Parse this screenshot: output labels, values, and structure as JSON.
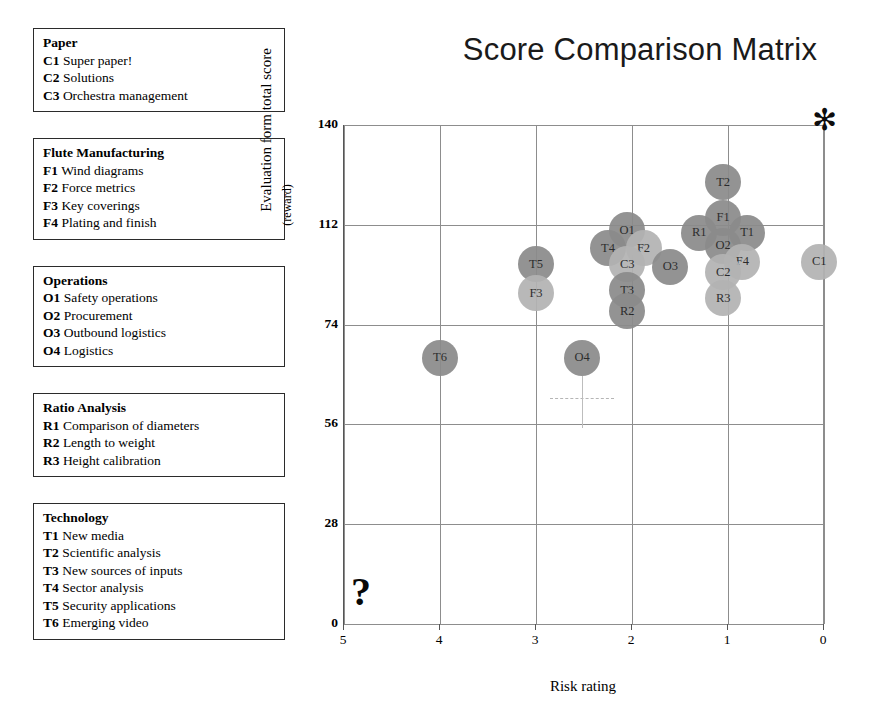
{
  "chart_data": {
    "type": "scatter",
    "title": "Score Comparison Matrix",
    "xlabel": "Risk rating",
    "ylabel": "Evaluation form total score",
    "ylabel_sub": "(reward)",
    "xlim": [
      5,
      0
    ],
    "ylim": [
      0,
      140
    ],
    "x_reversed": true,
    "grid": true,
    "legend_position": "left-panel",
    "xticks": [
      "5",
      "4",
      "3",
      "2",
      "1",
      "0"
    ],
    "yticks": [
      "140",
      "112",
      "74",
      "56",
      "28",
      "0"
    ],
    "points": [
      {
        "code": "T2",
        "x": 1.05,
        "y": 124,
        "shade": "dark"
      },
      {
        "code": "F1",
        "x": 1.05,
        "y": 114,
        "shade": "dark"
      },
      {
        "code": "R1",
        "x": 1.3,
        "y": 109,
        "shade": "dark"
      },
      {
        "code": "T1",
        "x": 0.8,
        "y": 109,
        "shade": "dark"
      },
      {
        "code": "O2",
        "x": 1.05,
        "y": 104,
        "shade": "dark"
      },
      {
        "code": "F4",
        "x": 0.85,
        "y": 98,
        "shade": "light"
      },
      {
        "code": "C2",
        "x": 1.05,
        "y": 94,
        "shade": "light"
      },
      {
        "code": "R3",
        "x": 1.05,
        "y": 84,
        "shade": "light"
      },
      {
        "code": "C1",
        "x": 0.05,
        "y": 98,
        "shade": "light"
      },
      {
        "code": "O1",
        "x": 2.05,
        "y": 110,
        "shade": "dark"
      },
      {
        "code": "T4",
        "x": 2.25,
        "y": 103,
        "shade": "dark"
      },
      {
        "code": "F2",
        "x": 1.88,
        "y": 103,
        "shade": "light"
      },
      {
        "code": "C3",
        "x": 2.05,
        "y": 97,
        "shade": "light"
      },
      {
        "code": "T3",
        "x": 2.05,
        "y": 87,
        "shade": "dark"
      },
      {
        "code": "R2",
        "x": 2.05,
        "y": 79,
        "shade": "dark"
      },
      {
        "code": "O3",
        "x": 1.6,
        "y": 96,
        "shade": "dark"
      },
      {
        "code": "T5",
        "x": 3.0,
        "y": 97,
        "shade": "dark"
      },
      {
        "code": "F3",
        "x": 3.0,
        "y": 86,
        "shade": "light"
      },
      {
        "code": "T6",
        "x": 4.0,
        "y": 68,
        "shade": "dark"
      },
      {
        "code": "O4",
        "x": 2.52,
        "y": 68,
        "shade": "dark"
      }
    ],
    "markers": [
      {
        "name": "star-marker",
        "glyph": "✻",
        "x": 0.0,
        "y": 140
      },
      {
        "name": "question-mark-marker",
        "glyph": "?",
        "x": 5.0,
        "y": 2
      }
    ]
  },
  "legend": {
    "groups": [
      {
        "title": "Paper",
        "items": [
          {
            "code": "C1",
            "label": "Super paper!"
          },
          {
            "code": "C2",
            "label": "Solutions"
          },
          {
            "code": "C3",
            "label": "Orchestra management"
          }
        ]
      },
      {
        "title": "Flute Manufacturing",
        "items": [
          {
            "code": "F1",
            "label": "Wind diagrams"
          },
          {
            "code": "F2",
            "label": "Force metrics"
          },
          {
            "code": "F3",
            "label": "Key coverings"
          },
          {
            "code": "F4",
            "label": "Plating and finish"
          }
        ]
      },
      {
        "title": "Operations",
        "items": [
          {
            "code": "O1",
            "label": "Safety operations"
          },
          {
            "code": "O2",
            "label": "Procurement"
          },
          {
            "code": "O3",
            "label": "Outbound logistics"
          },
          {
            "code": "O4",
            "label": "Logistics"
          }
        ]
      },
      {
        "title": "Ratio Analysis",
        "items": [
          {
            "code": "R1",
            "label": "Comparison of diameters"
          },
          {
            "code": "R2",
            "label": "Length to weight"
          },
          {
            "code": "R3",
            "label": "Height calibration"
          }
        ]
      },
      {
        "title": "Technology",
        "items": [
          {
            "code": "T1",
            "label": "New media"
          },
          {
            "code": "T2",
            "label": "Scientific analysis"
          },
          {
            "code": "T3",
            "label": "New sources of inputs"
          },
          {
            "code": "T4",
            "label": "Sector analysis"
          },
          {
            "code": "T5",
            "label": "Security applications"
          },
          {
            "code": "T6",
            "label": "Emerging video"
          }
        ]
      }
    ]
  },
  "colors": {
    "bubble_dark": "#8b8b8b",
    "bubble_light": "#b3b3b3",
    "grid": "#8d8d8d",
    "text": "#000000"
  }
}
